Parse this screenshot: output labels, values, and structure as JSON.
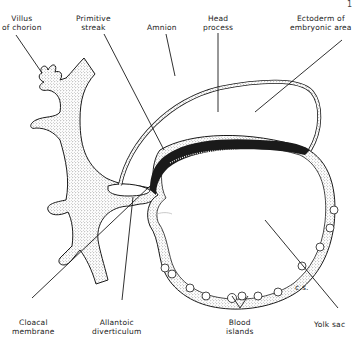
{
  "figure": {
    "page_mark": "1",
    "labels": {
      "villus": [
        "Villus",
        "of chorion"
      ],
      "primitive_streak": [
        "Primitive",
        "streak"
      ],
      "amnion": [
        "Amnion"
      ],
      "head_process": [
        "Head",
        "process"
      ],
      "ectoderm": [
        "Ectoderm of",
        "embryonic area"
      ],
      "cloacal": [
        "Cloacal",
        "membrane"
      ],
      "allantoic": [
        "Allantoic",
        "diverticulum"
      ],
      "blood_islands": [
        "Blood",
        "islands"
      ],
      "yolk_sac": [
        "Yolk sac"
      ],
      "cs": "c.s."
    },
    "colors": {
      "ink": "#1a1a1a",
      "stipple": "#555555",
      "background": "#ffffff"
    }
  }
}
